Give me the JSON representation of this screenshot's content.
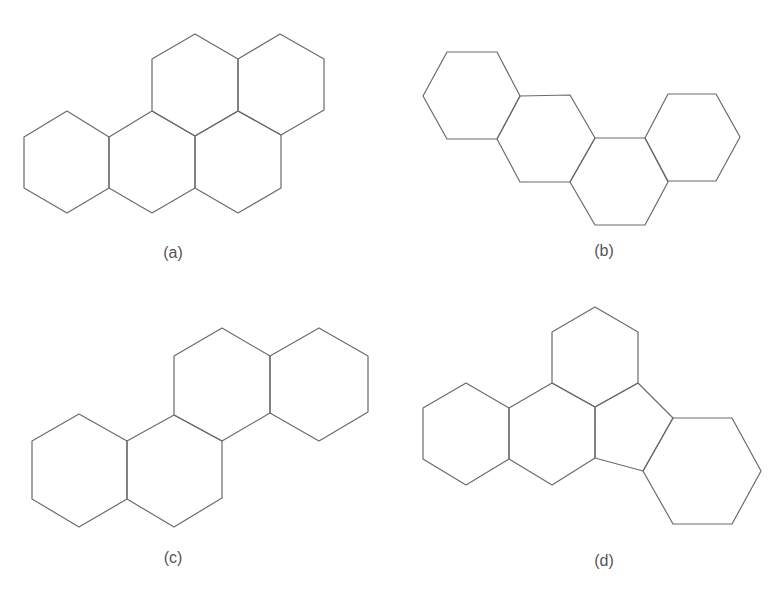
{
  "figure": {
    "stroke_color": "#6b6b6b",
    "background": "#ffffff",
    "panels": [
      {
        "id": "a",
        "label": "(a)",
        "label_pos": [
          173,
          244
        ],
        "description": "five fused hexagonal rings (two upper, three lower)",
        "rings": [
          {
            "type": "hexagon",
            "points": [
              [
                67,
                111
              ],
              [
                109,
                137
              ],
              [
                109,
                188
              ],
              [
                67,
                213
              ],
              [
                24,
                188
              ],
              [
                24,
                137
              ]
            ]
          },
          {
            "type": "hexagon",
            "points": [
              [
                109,
                137
              ],
              [
                152,
                111
              ],
              [
                195,
                136
              ],
              [
                195,
                188
              ],
              [
                152,
                213
              ],
              [
                109,
                188
              ]
            ]
          },
          {
            "type": "hexagon",
            "points": [
              [
                195,
                136
              ],
              [
                238,
                111
              ],
              [
                281,
                135
              ],
              [
                281,
                188
              ],
              [
                238,
                213
              ],
              [
                195,
                188
              ]
            ]
          },
          {
            "type": "hexagon",
            "points": [
              [
                195,
                34
              ],
              [
                238,
                59
              ],
              [
                238,
                111
              ],
              [
                195,
                136
              ],
              [
                152,
                111
              ],
              [
                152,
                59
              ]
            ]
          },
          {
            "type": "hexagon",
            "points": [
              [
                280,
                34
              ],
              [
                324,
                59
              ],
              [
                324,
                110
              ],
              [
                281,
                135
              ],
              [
                238,
                111
              ],
              [
                238,
                59
              ]
            ]
          }
        ]
      },
      {
        "id": "b",
        "label": "(b)",
        "label_pos": [
          604,
          242
        ],
        "description": "four fused hexagonal rings in zig-zag chain",
        "rings": [
          {
            "type": "hexagon",
            "points": [
              [
                447,
                52
              ],
              [
                497,
                52
              ],
              [
                520,
                96
              ],
              [
                497,
                139
              ],
              [
                447,
                139
              ],
              [
                423,
                96
              ]
            ]
          },
          {
            "type": "hexagon",
            "points": [
              [
                520,
                96
              ],
              [
                570,
                95
              ],
              [
                595,
                138
              ],
              [
                570,
                182
              ],
              [
                520,
                182
              ],
              [
                497,
                139
              ]
            ]
          },
          {
            "type": "hexagon",
            "points": [
              [
                595,
                138
              ],
              [
                645,
                138
              ],
              [
                668,
                182
              ],
              [
                645,
                225
              ],
              [
                595,
                225
              ],
              [
                570,
                182
              ]
            ]
          },
          {
            "type": "hexagon",
            "points": [
              [
                668,
                94
              ],
              [
                716,
                94
              ],
              [
                740,
                137
              ],
              [
                716,
                181
              ],
              [
                668,
                181
              ],
              [
                645,
                138
              ]
            ]
          }
        ]
      },
      {
        "id": "c",
        "label": "(c)",
        "label_pos": [
          173,
          549
        ],
        "description": "four fused hexagonal rings in stepped arrangement",
        "rings": [
          {
            "type": "hexagon",
            "points": [
              [
                79,
                414
              ],
              [
                127,
                441
              ],
              [
                127,
                499
              ],
              [
                79,
                527
              ],
              [
                32,
                499
              ],
              [
                32,
                441
              ]
            ]
          },
          {
            "type": "hexagon",
            "points": [
              [
                127,
                441
              ],
              [
                174,
                415
              ],
              [
                222,
                441
              ],
              [
                222,
                498
              ],
              [
                174,
                527
              ],
              [
                127,
                499
              ]
            ]
          },
          {
            "type": "hexagon",
            "points": [
              [
                222,
                328
              ],
              [
                270,
                356
              ],
              [
                270,
                413
              ],
              [
                222,
                441
              ],
              [
                174,
                415
              ],
              [
                174,
                356
              ]
            ]
          },
          {
            "type": "hexagon",
            "points": [
              [
                319,
                328
              ],
              [
                368,
                356
              ],
              [
                368,
                412
              ],
              [
                319,
                441
              ],
              [
                270,
                413
              ],
              [
                270,
                356
              ]
            ]
          }
        ]
      },
      {
        "id": "d",
        "label": "(d)",
        "label_pos": [
          604,
          552
        ],
        "description": "four hexagonal rings and one five-membered ring",
        "rings": [
          {
            "type": "hexagon",
            "points": [
              [
                595,
                307
              ],
              [
                638,
                332
              ],
              [
                638,
                383
              ],
              [
                595,
                407
              ],
              [
                552,
                383
              ],
              [
                552,
                332
              ]
            ]
          },
          {
            "type": "hexagon",
            "points": [
              [
                466,
                383
              ],
              [
                509,
                408
              ],
              [
                509,
                459
              ],
              [
                466,
                485
              ],
              [
                423,
                459
              ],
              [
                423,
                408
              ]
            ]
          },
          {
            "type": "hexagon",
            "points": [
              [
                509,
                408
              ],
              [
                552,
                383
              ],
              [
                595,
                407
              ],
              [
                595,
                458
              ],
              [
                552,
                485
              ],
              [
                509,
                459
              ]
            ]
          },
          {
            "type": "pentagon",
            "points": [
              [
                595,
                407
              ],
              [
                638,
                383
              ],
              [
                673,
                418
              ],
              [
                643,
                471
              ],
              [
                595,
                458
              ]
            ]
          },
          {
            "type": "hexagon",
            "points": [
              [
                673,
                418
              ],
              [
                732,
                418
              ],
              [
                761,
                471
              ],
              [
                732,
                524
              ],
              [
                673,
                524
              ],
              [
                643,
                471
              ]
            ]
          }
        ]
      }
    ]
  }
}
